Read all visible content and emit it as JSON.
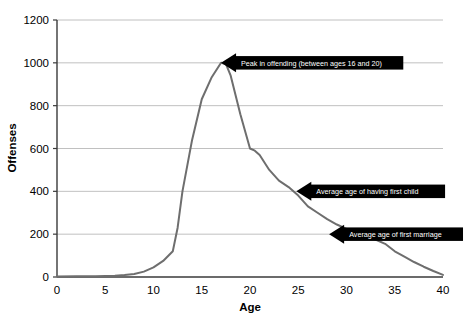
{
  "chart_data": {
    "type": "line",
    "title": "",
    "xlabel": "Age",
    "ylabel": "Offenses",
    "xlim": [
      0,
      40
    ],
    "ylim": [
      0,
      1200
    ],
    "grid": true,
    "legend": "none",
    "line_color": "#6e6e6e",
    "annotation_color": "#000000",
    "xticks": [
      "0",
      "5",
      "10",
      "15",
      "20",
      "25",
      "30",
      "35",
      "40"
    ],
    "xtick_values": [
      0,
      5,
      10,
      15,
      20,
      25,
      30,
      35,
      40
    ],
    "yticks": [
      "0",
      "200",
      "400",
      "600",
      "800",
      "1000",
      "1200"
    ],
    "ytick_values": [
      0,
      200,
      400,
      600,
      800,
      1000,
      1200
    ],
    "x": [
      0,
      2,
      4,
      6,
      7,
      8,
      9,
      10,
      11,
      12,
      12.5,
      13,
      14,
      15,
      16,
      17,
      17.5,
      18,
      19,
      20,
      20.5,
      21,
      22,
      23,
      24,
      25,
      26,
      27,
      28,
      29,
      30,
      31,
      32,
      33,
      34,
      35,
      36,
      37,
      38,
      39,
      40
    ],
    "y": [
      2,
      3,
      4,
      6,
      9,
      14,
      25,
      45,
      75,
      120,
      230,
      400,
      640,
      830,
      930,
      1000,
      995,
      940,
      760,
      600,
      590,
      570,
      500,
      450,
      420,
      380,
      330,
      300,
      270,
      245,
      225,
      205,
      190,
      175,
      155,
      120,
      95,
      70,
      48,
      28,
      10
    ],
    "series": [
      {
        "name": "Offenses by age",
        "values": [
          2,
          3,
          4,
          6,
          9,
          14,
          25,
          45,
          75,
          120,
          230,
          400,
          640,
          830,
          930,
          1000,
          995,
          940,
          760,
          600,
          590,
          570,
          500,
          450,
          420,
          380,
          330,
          300,
          270,
          245,
          225,
          205,
          190,
          175,
          155,
          120,
          95,
          70,
          48,
          28,
          10
        ]
      }
    ],
    "annotations": [
      {
        "id": "peak-offending",
        "label": "Peak in offending (between ages 16 and 20)",
        "point_x": 17,
        "point_y": 1000,
        "arrow_direction": "left"
      },
      {
        "id": "first-child",
        "label": "Average age of having first child",
        "point_x": 24.8,
        "point_y": 400,
        "arrow_direction": "left"
      },
      {
        "id": "first-marriage",
        "label": "Average age of first marriage",
        "point_x": 28.2,
        "point_y": 200,
        "arrow_direction": "left"
      }
    ]
  }
}
